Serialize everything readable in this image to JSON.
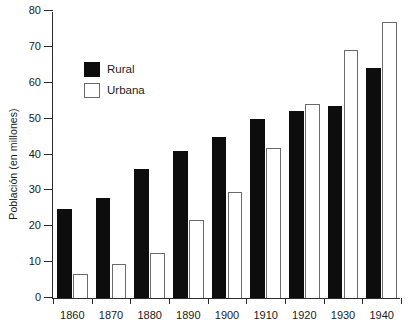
{
  "chart_data": {
    "type": "bar",
    "title": "",
    "xlabel": "",
    "ylabel": "Población (en millones)",
    "categories": [
      "1860",
      "1870",
      "1880",
      "1890",
      "1900",
      "1910",
      "1920",
      "1930",
      "1940"
    ],
    "series": [
      {
        "name": "Rural",
        "values": [
          24.7,
          28.0,
          36.0,
          41.0,
          45.0,
          50.0,
          52.0,
          53.5,
          64.0
        ]
      },
      {
        "name": "Urbana",
        "values": [
          6.6,
          9.5,
          12.6,
          21.8,
          29.6,
          41.8,
          54.0,
          69.0,
          77.0
        ]
      }
    ],
    "ylim": [
      0,
      80
    ],
    "ytick_labels": [
      "0",
      "10",
      "20",
      "30",
      "40",
      "50",
      "60",
      "70",
      "80"
    ],
    "ytick_values": [
      0,
      10,
      20,
      30,
      40,
      50,
      60,
      70,
      80
    ],
    "grid": false,
    "legend_position": "upper-left-inside",
    "legend": [
      "Rural",
      "Urbana"
    ],
    "colors": {
      "rural": "#0d0d0d",
      "urbana": "#ffffff",
      "urbana_border": "#6b6b6b",
      "axis": "#2b2b2b",
      "background": "#ffffff"
    }
  }
}
